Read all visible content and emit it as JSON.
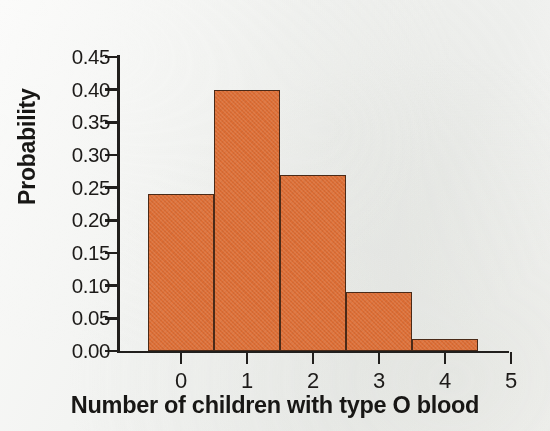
{
  "chart_data": {
    "type": "bar",
    "title": "",
    "subtitle": "",
    "xlabel": "Number of children with type O blood",
    "ylabel": "Probability",
    "categories": [
      "0",
      "1",
      "2",
      "3",
      "4",
      "5"
    ],
    "values": [
      0.24,
      0.4,
      0.27,
      0.09,
      0.018,
      0.0
    ],
    "series": [
      {
        "name": "Probability",
        "values": [
          0.24,
          0.4,
          0.27,
          0.09,
          0.018,
          0.0
        ]
      }
    ],
    "ylim": [
      0.0,
      0.45
    ],
    "xlim": [
      -0.5,
      5.5
    ],
    "ytick_labels": [
      "0.00",
      "0.05",
      "0.10",
      "0.15",
      "0.20",
      "0.25",
      "0.30",
      "0.35",
      "0.40",
      "0.45"
    ],
    "ytick_values": [
      0.0,
      0.05,
      0.1,
      0.15,
      0.2,
      0.25,
      0.3,
      0.35,
      0.4,
      0.45
    ],
    "xtick_labels": [
      "0",
      "1",
      "2",
      "3",
      "4",
      "5"
    ],
    "grid": false,
    "legend": false,
    "legend_position": "none",
    "bar_width": 1.0,
    "annotations": []
  },
  "style": {
    "bar_fill": "#dd6e35",
    "bar_edge": "#4a2a18",
    "axis_color": "#211f1d",
    "text_color": "#1d1b19",
    "title_color": "#181715",
    "background": "#f4f5f3"
  }
}
